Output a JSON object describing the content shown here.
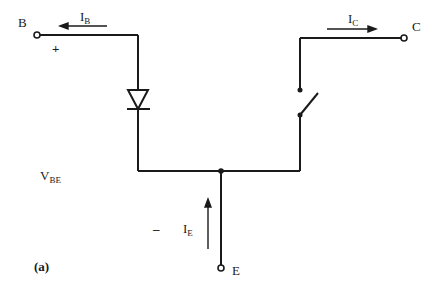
{
  "diagram": {
    "caption": "(a)",
    "terminals": {
      "base": "B",
      "collector": "C",
      "emitter": "E"
    },
    "currents": {
      "base": {
        "main": "I",
        "sub": "B"
      },
      "collector": {
        "main": "I",
        "sub": "C"
      },
      "emitter": {
        "main": "I",
        "sub": "E"
      }
    },
    "voltage": {
      "main": "V",
      "sub": "BE",
      "plus": "+",
      "minus": "–"
    },
    "components": [
      "diode",
      "switch"
    ],
    "colors": {
      "line": "#1a1a1a",
      "background": "#ffffff"
    }
  }
}
